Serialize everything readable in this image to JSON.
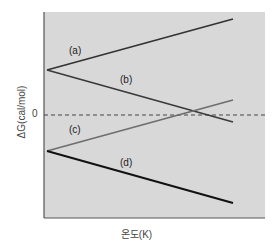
{
  "chart_data": {
    "type": "line",
    "title": "",
    "xlabel": "온도(K)",
    "ylabel": "ΔG(cal/mol)",
    "y_ticks": [
      "0"
    ],
    "zero_line": {
      "style": "dashed",
      "value": 0
    },
    "xlim": [
      0,
      100
    ],
    "ylim": [
      -103,
      103
    ],
    "grid": false,
    "legend": "inline labels",
    "series": [
      {
        "name": "(a)",
        "x": [
          0,
          100
        ],
        "values": [
          45,
          96
        ],
        "color": "#333333"
      },
      {
        "name": "(b)",
        "x": [
          0,
          100
        ],
        "values": [
          45,
          -7
        ],
        "color": "#3a3a3a"
      },
      {
        "name": "(c)",
        "x": [
          0,
          100
        ],
        "values": [
          -36,
          15
        ],
        "color": "#6e6e6e"
      },
      {
        "name": "(d)",
        "x": [
          0,
          100
        ],
        "values": [
          -36,
          -88
        ],
        "color": "#111111"
      }
    ],
    "annotations": [
      "(a)",
      "(b)",
      "(c)",
      "(d)"
    ]
  },
  "colors": {
    "plot_background": "#d8d8d8",
    "axis": "#555555",
    "zero_line": "#444444"
  }
}
